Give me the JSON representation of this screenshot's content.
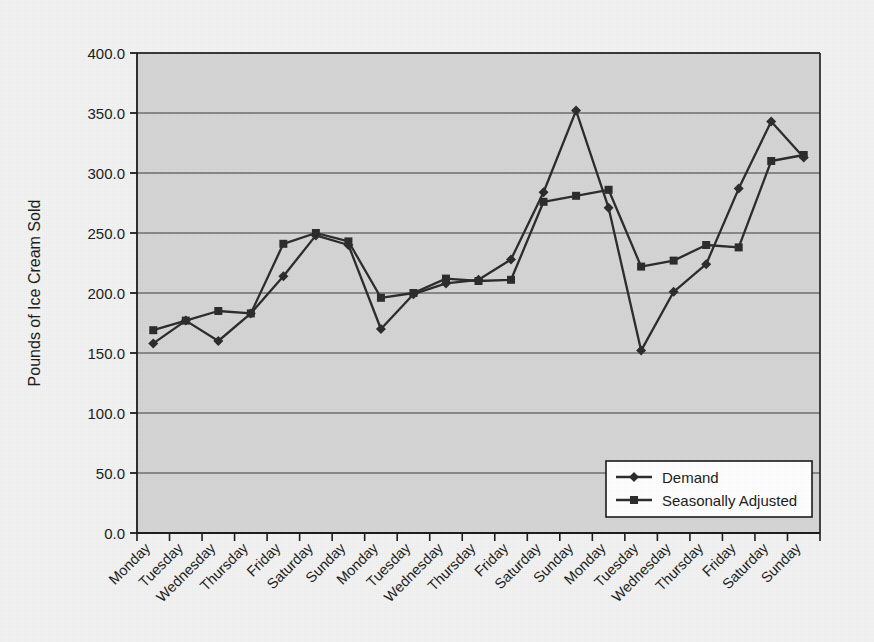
{
  "chart_data": {
    "type": "line",
    "title": "",
    "xlabel": "",
    "ylabel": "Pounds of Ice Cream Sold",
    "ylim": [
      0,
      400
    ],
    "ytick_values": [
      0,
      50,
      100,
      150,
      200,
      250,
      300,
      350,
      400
    ],
    "ytick_labels": [
      "0.0",
      "50.0",
      "100.0",
      "150.0",
      "200.0",
      "250.0",
      "300.0",
      "350.0",
      "400.0"
    ],
    "grid": true,
    "legend_position": "lower right",
    "categories": [
      "Monday",
      "Tuesday",
      "Wednesday",
      "Thursday",
      "Friday",
      "Saturday",
      "Sunday",
      "Monday",
      "Tuesday",
      "Wednesday",
      "Thursday",
      "Friday",
      "Saturday",
      "Sunday",
      "Monday",
      "Tuesday",
      "Wednesday",
      "Thursday",
      "Friday",
      "Saturday",
      "Sunday"
    ],
    "series": [
      {
        "name": "Demand",
        "marker": "diamond",
        "color": "#2b2b2b",
        "values": [
          158,
          177,
          160,
          183,
          214,
          248,
          240,
          170,
          199,
          208,
          211,
          228,
          284,
          352,
          271,
          152,
          201,
          224,
          287,
          343,
          313
        ]
      },
      {
        "name": "Seasonally Adjusted",
        "marker": "square",
        "color": "#2b2b2b",
        "values": [
          169,
          177,
          185,
          183,
          241,
          250,
          243,
          196,
          200,
          212,
          210,
          211,
          276,
          281,
          286,
          222,
          227,
          240,
          238,
          310,
          315
        ]
      }
    ]
  },
  "legend": {
    "items": [
      {
        "label": "Demand",
        "marker": "diamond"
      },
      {
        "label": "Seasonally Adjusted",
        "marker": "square"
      }
    ]
  },
  "colors": {
    "page_background": "#f2f2f2",
    "plot_background": "#d4d4d4",
    "axis": "#1a1a1a",
    "gridline": "#3a3a3a",
    "series": "#2b2b2b",
    "legend_background": "#ffffff"
  }
}
